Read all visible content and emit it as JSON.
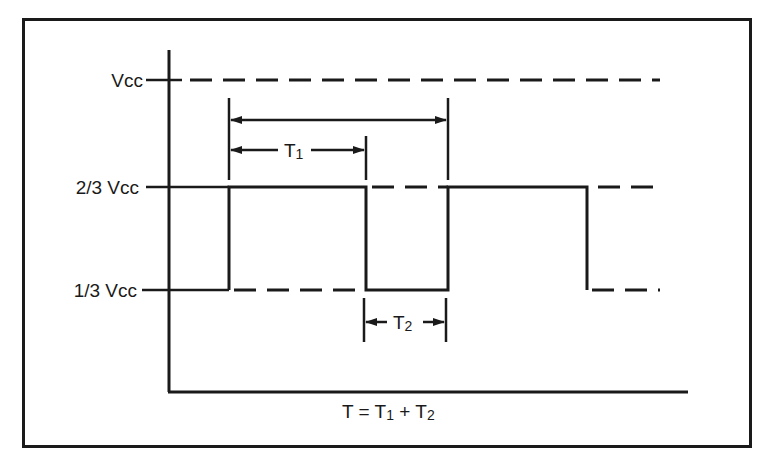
{
  "diagram": {
    "levels": [
      {
        "label": "Vcc",
        "y": 80
      },
      {
        "label": "2/3 Vcc",
        "y": 187
      },
      {
        "label": "1/3 Vcc",
        "y": 290
      }
    ],
    "labels": {
      "vcc": "Vcc",
      "two_thirds": "2/3 Vcc",
      "one_third": "1/3 Vcc",
      "t1": "T",
      "t1_sub": "1",
      "t2": "T",
      "t2_sub": "2",
      "formula_T": "T = T",
      "formula_sub1": "1",
      "formula_plus": " + T",
      "formula_sub2": "2"
    },
    "annotations": [
      {
        "name": "T (period)",
        "from_x": 229,
        "to_x": 448,
        "y": 120
      },
      {
        "name": "T1 (high time)",
        "from_x": 229,
        "to_x": 366,
        "y": 150
      },
      {
        "name": "T2 (low time)",
        "from_x": 364,
        "to_x": 446,
        "y": 322
      }
    ],
    "formula": "T = T1 + T2",
    "colors": {
      "ink": "#1a1a1a",
      "background": "#ffffff"
    }
  }
}
